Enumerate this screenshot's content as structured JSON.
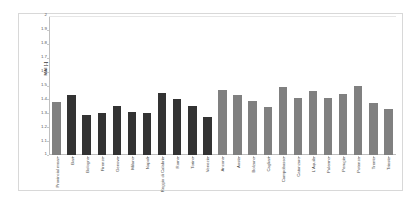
{
  "figure": {
    "background_color": "#ffffff",
    "frame_color": "#d8d8d8"
  },
  "chart_data": {
    "type": "bar",
    "title": "",
    "xlabel": "",
    "ylabel": "MAI [-]",
    "ylim": [
      1,
      2
    ],
    "ytick_step": 0.1,
    "ytick_labels": [
      "2",
      "1.9",
      "1.8",
      "1.7",
      "1.6",
      "1.5",
      "1.4",
      "1.3",
      "1.2",
      "1.1",
      "1"
    ],
    "grid": false,
    "legend": "none",
    "colors": {
      "provincial_mean": "#808080",
      "metropolitan_city": "#333333",
      "other_city": "#808080"
    },
    "categories": [
      "Provincial mean",
      "Bari",
      "Bologna",
      "Firenze",
      "Genova",
      "Milano",
      "Napoli",
      "Reggio di Calabria",
      "Roma",
      "Torino",
      "Venezia",
      "Ancona",
      "Aosta",
      "Bolzano",
      "Cagliari",
      "Campobasso",
      "Catanzaro",
      "L'Aquila",
      "Palermo",
      "Perugia",
      "Potenza",
      "Trento",
      "Trieste"
    ],
    "values": [
      1.385,
      1.43,
      1.285,
      1.305,
      1.355,
      1.31,
      1.3,
      1.445,
      1.4,
      1.355,
      1.27,
      1.47,
      1.43,
      1.39,
      1.345,
      1.49,
      1.41,
      1.46,
      1.41,
      1.44,
      1.5,
      1.375,
      1.33
    ],
    "groups": [
      "provincial_mean",
      "metropolitan_city",
      "metropolitan_city",
      "metropolitan_city",
      "metropolitan_city",
      "metropolitan_city",
      "metropolitan_city",
      "metropolitan_city",
      "metropolitan_city",
      "metropolitan_city",
      "metropolitan_city",
      "other_city",
      "other_city",
      "other_city",
      "other_city",
      "other_city",
      "other_city",
      "other_city",
      "other_city",
      "other_city",
      "other_city",
      "other_city",
      "other_city"
    ]
  }
}
